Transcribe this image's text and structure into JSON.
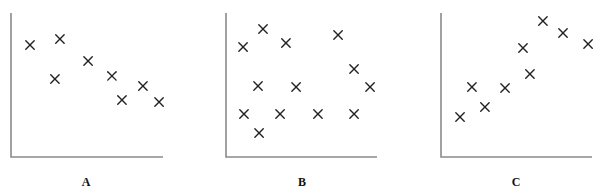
{
  "chart_data": [
    {
      "type": "scatter",
      "panel_label": "A",
      "title": "",
      "xlabel": "",
      "ylabel": "",
      "xlim": [
        0,
        100
      ],
      "ylim": [
        0,
        100
      ],
      "grid": false,
      "marker": "x",
      "units": "relative (no axis ticks shown)",
      "points": [
        {
          "x": 12.5,
          "y": 77.8
        },
        {
          "x": 32.2,
          "y": 81.9
        },
        {
          "x": 28.9,
          "y": 54.2
        },
        {
          "x": 50.7,
          "y": 66.7
        },
        {
          "x": 66.4,
          "y": 56.3
        },
        {
          "x": 73.0,
          "y": 39.6
        },
        {
          "x": 86.8,
          "y": 49.3
        },
        {
          "x": 97.4,
          "y": 38.2
        }
      ]
    },
    {
      "type": "scatter",
      "panel_label": "B",
      "title": "",
      "xlabel": "",
      "ylabel": "",
      "xlim": [
        0,
        100
      ],
      "ylim": [
        0,
        100
      ],
      "grid": false,
      "marker": "x",
      "units": "relative (no axis ticks shown)",
      "points": [
        {
          "x": 11.3,
          "y": 76.4
        },
        {
          "x": 24.5,
          "y": 88.9
        },
        {
          "x": 39.7,
          "y": 79.2
        },
        {
          "x": 74.2,
          "y": 84.7
        },
        {
          "x": 84.8,
          "y": 61.1
        },
        {
          "x": 21.2,
          "y": 49.3
        },
        {
          "x": 46.4,
          "y": 48.6
        },
        {
          "x": 95.4,
          "y": 48.6
        },
        {
          "x": 11.9,
          "y": 29.9
        },
        {
          "x": 35.8,
          "y": 29.9
        },
        {
          "x": 60.9,
          "y": 29.9
        },
        {
          "x": 84.8,
          "y": 29.9
        },
        {
          "x": 21.9,
          "y": 16.7
        }
      ]
    },
    {
      "type": "scatter",
      "panel_label": "C",
      "title": "",
      "xlabel": "",
      "ylabel": "",
      "xlim": [
        0,
        100
      ],
      "ylim": [
        0,
        100
      ],
      "grid": false,
      "marker": "x",
      "units": "relative (no axis ticks shown)",
      "points": [
        {
          "x": 12.6,
          "y": 27.8
        },
        {
          "x": 20.5,
          "y": 48.6
        },
        {
          "x": 29.1,
          "y": 34.7
        },
        {
          "x": 42.4,
          "y": 47.9
        },
        {
          "x": 54.3,
          "y": 75.7
        },
        {
          "x": 58.9,
          "y": 57.6
        },
        {
          "x": 67.5,
          "y": 94.4
        },
        {
          "x": 80.8,
          "y": 86.1
        },
        {
          "x": 97.4,
          "y": 78.5
        }
      ]
    }
  ]
}
